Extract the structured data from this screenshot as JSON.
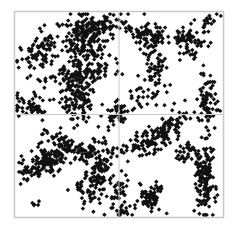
{
  "chart_data": {
    "type": "scatter",
    "title": "",
    "xlabel": "",
    "ylabel": "",
    "xlim": [
      0,
      1
    ],
    "ylim": [
      0,
      1
    ],
    "grid": false,
    "legend": null,
    "reference_lines": {
      "x": 0.5,
      "y": 0.5
    },
    "marker": {
      "shape": "diamond",
      "color": "#111111",
      "size": 2.2
    },
    "frame_color": "#c8c8c8",
    "divider_color": "#c8c8c8",
    "plot_box_px": {
      "left": 14,
      "top": 11,
      "right": 224,
      "bottom": 218
    },
    "clusters": [
      {
        "name": "upper-left-diagonal-arm",
        "cx": 0.14,
        "cy": 0.8,
        "sx": 0.045,
        "sy": 0.07,
        "n": 90,
        "rot": -0.9
      },
      {
        "name": "upper-center-dense-band",
        "cx": 0.34,
        "cy": 0.86,
        "sx": 0.05,
        "sy": 0.06,
        "n": 170,
        "rot": 0
      },
      {
        "name": "upper-center-right-arm",
        "cx": 0.39,
        "cy": 0.93,
        "sx": 0.06,
        "sy": 0.025,
        "n": 90,
        "rot": 0.2
      },
      {
        "name": "mid-left-horizontal-band",
        "cx": 0.32,
        "cy": 0.7,
        "sx": 0.09,
        "sy": 0.03,
        "n": 110,
        "rot": 0.1
      },
      {
        "name": "center-left-vertical-column",
        "cx": 0.3,
        "cy": 0.58,
        "sx": 0.035,
        "sy": 0.06,
        "n": 120,
        "rot": 0
      },
      {
        "name": "left-edge-midband",
        "cx": 0.08,
        "cy": 0.55,
        "sx": 0.04,
        "sy": 0.03,
        "n": 50,
        "rot": 0
      },
      {
        "name": "center-small-cluster",
        "cx": 0.5,
        "cy": 0.5,
        "sx": 0.025,
        "sy": 0.025,
        "n": 45,
        "rot": 0
      },
      {
        "name": "upper-right-left-blob",
        "cx": 0.64,
        "cy": 0.88,
        "sx": 0.05,
        "sy": 0.035,
        "n": 90,
        "rot": -0.3
      },
      {
        "name": "upper-right-right-blob",
        "cx": 0.83,
        "cy": 0.85,
        "sx": 0.04,
        "sy": 0.04,
        "n": 80,
        "rot": 0.5
      },
      {
        "name": "upper-right-tail",
        "cx": 0.92,
        "cy": 0.93,
        "sx": 0.03,
        "sy": 0.02,
        "n": 18,
        "rot": 0.8
      },
      {
        "name": "right-center-drop",
        "cx": 0.68,
        "cy": 0.72,
        "sx": 0.025,
        "sy": 0.06,
        "n": 45,
        "rot": 0.3
      },
      {
        "name": "right-edge-vertical-band",
        "cx": 0.92,
        "cy": 0.57,
        "sx": 0.025,
        "sy": 0.07,
        "n": 80,
        "rot": 0
      },
      {
        "name": "mid-right-scatter",
        "cx": 0.64,
        "cy": 0.6,
        "sx": 0.07,
        "sy": 0.05,
        "n": 40,
        "rot": 0.4
      },
      {
        "name": "lower-left-arc",
        "cx": 0.16,
        "cy": 0.27,
        "sx": 0.07,
        "sy": 0.03,
        "n": 150,
        "rot": 0.45
      },
      {
        "name": "lower-left-arc-top",
        "cx": 0.22,
        "cy": 0.36,
        "sx": 0.06,
        "sy": 0.025,
        "n": 50,
        "rot": -0.2
      },
      {
        "name": "lower-center-arc",
        "cx": 0.4,
        "cy": 0.22,
        "sx": 0.04,
        "sy": 0.08,
        "n": 140,
        "rot": -0.35
      },
      {
        "name": "lower-center-arc-top",
        "cx": 0.35,
        "cy": 0.33,
        "sx": 0.04,
        "sy": 0.03,
        "n": 45,
        "rot": 0.6
      },
      {
        "name": "lower-left-stray",
        "cx": 0.1,
        "cy": 0.07,
        "sx": 0.01,
        "sy": 0.01,
        "n": 5,
        "rot": 0
      },
      {
        "name": "lower-right-horizontal-band",
        "cx": 0.65,
        "cy": 0.37,
        "sx": 0.07,
        "sy": 0.03,
        "n": 110,
        "rot": 0.3
      },
      {
        "name": "lower-right-diagonal-top",
        "cx": 0.74,
        "cy": 0.45,
        "sx": 0.05,
        "sy": 0.025,
        "n": 50,
        "rot": 0.5
      },
      {
        "name": "lower-right-small-cluster",
        "cx": 0.65,
        "cy": 0.1,
        "sx": 0.03,
        "sy": 0.035,
        "n": 70,
        "rot": 0
      },
      {
        "name": "lower-right-vertical-band",
        "cx": 0.91,
        "cy": 0.17,
        "sx": 0.025,
        "sy": 0.09,
        "n": 140,
        "rot": 0
      },
      {
        "name": "lower-right-diag-connector",
        "cx": 0.83,
        "cy": 0.31,
        "sx": 0.04,
        "sy": 0.025,
        "n": 40,
        "rot": -0.6
      },
      {
        "name": "bottom-center-edge",
        "cx": 0.52,
        "cy": 0.04,
        "sx": 0.03,
        "sy": 0.02,
        "n": 25,
        "rot": 0
      },
      {
        "name": "left-quadrant-border-cluster",
        "cx": 0.5,
        "cy": 0.13,
        "sx": 0.02,
        "sy": 0.04,
        "n": 30,
        "rot": 0
      }
    ],
    "seed": 7,
    "approx_total_points": 1930
  }
}
